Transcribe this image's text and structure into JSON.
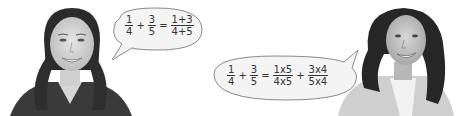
{
  "left_speaker": {
    "image": "smiling-girl-with-pigtails-photo",
    "speech": {
      "terms": [
        {
          "num": "1",
          "den": "4"
        },
        {
          "op": "+"
        },
        {
          "num": "3",
          "den": "5"
        },
        {
          "op": "="
        },
        {
          "num": "1+3",
          "den": "4+5"
        }
      ]
    }
  },
  "right_speaker": {
    "image": "smiling-woman-with-curly-hair-photo",
    "speech": {
      "terms": [
        {
          "num": "1",
          "den": "4"
        },
        {
          "op": "+"
        },
        {
          "num": "3",
          "den": "5"
        },
        {
          "op": "="
        },
        {
          "num": "1x5",
          "den": "4x5"
        },
        {
          "op": "+"
        },
        {
          "num": "3x4",
          "den": "5x4"
        }
      ]
    }
  },
  "colors": {
    "bubble_fill": "#f4f4f4",
    "bubble_stroke": "#8a8a8a",
    "text": "#333333"
  }
}
